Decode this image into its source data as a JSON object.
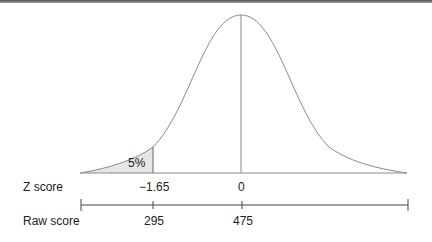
{
  "diagram": {
    "type": "normal-distribution",
    "shaded_area_label": "5%",
    "rows": [
      {
        "label": "Z score",
        "values": [
          "−1.65",
          "0"
        ]
      },
      {
        "label": "Raw score",
        "values": [
          "295",
          "475"
        ]
      }
    ],
    "colors": {
      "curve": "#8a8a8a",
      "shade": "#e6e6e6",
      "axis": "#444444"
    }
  }
}
